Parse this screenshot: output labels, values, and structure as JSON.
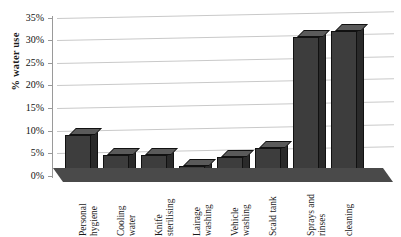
{
  "chart_data": {
    "type": "bar",
    "title": "",
    "subtitle": "",
    "xlabel": "",
    "ylabel": "% water use",
    "ylim": [
      0,
      35
    ],
    "ytick_values": [
      0,
      5,
      10,
      15,
      20,
      25,
      30,
      35
    ],
    "ytick_labels": [
      "0%",
      "5%",
      "10%",
      "15%",
      "20%",
      "25%",
      "30%",
      "35%"
    ],
    "grid": true,
    "legend": false,
    "legend_position": "none",
    "bar_style": "3d",
    "bar_color": "#3d3d3d",
    "grid_color": "#c9c9c9",
    "floor_color": "#4a4a4a",
    "categories": [
      "Personal hygiene",
      "Cooling water",
      "Knife sterilising",
      "Lairage washing",
      "Vehicle washing",
      "Scald tank",
      "Sprays and rinses",
      "cleaning"
    ],
    "categories_wrapped": [
      [
        "Personal",
        "hygiene"
      ],
      [
        "Cooling",
        "water"
      ],
      [
        "Knife",
        "sterilising"
      ],
      [
        "Lairage",
        "washing"
      ],
      [
        "Vehicle",
        "washing"
      ],
      [
        "Scald tank",
        ""
      ],
      [
        "Sprays and",
        "rinses"
      ],
      [
        "cleaning",
        ""
      ]
    ],
    "values": [
      10,
      5.5,
      5.5,
      3,
      5,
      7,
      31.5,
      33
    ]
  },
  "axis": {
    "y_title": "% water use"
  },
  "ticks": [
    {
      "label": "35%",
      "value": 35
    },
    {
      "label": "30%",
      "value": 30
    },
    {
      "label": "25%",
      "value": 25
    },
    {
      "label": "20%",
      "value": 20
    },
    {
      "label": "15%",
      "value": 15
    },
    {
      "label": "10%",
      "value": 10
    },
    {
      "label": "5%",
      "value": 5
    },
    {
      "label": "0%",
      "value": 0
    }
  ],
  "bars": [
    {
      "cat1": "Personal",
      "cat2": "hygiene",
      "value": 10
    },
    {
      "cat1": "Cooling",
      "cat2": "water",
      "value": 5.5
    },
    {
      "cat1": "Knife",
      "cat2": "sterilising",
      "value": 5.5
    },
    {
      "cat1": "Lairage",
      "cat2": "washing",
      "value": 3
    },
    {
      "cat1": "Vehicle",
      "cat2": "washing",
      "value": 5
    },
    {
      "cat1": "Scald tank",
      "cat2": "",
      "value": 7
    },
    {
      "cat1": "Sprays and",
      "cat2": "rinses",
      "value": 31.5
    },
    {
      "cat1": "cleaning",
      "cat2": "",
      "value": 33
    }
  ]
}
